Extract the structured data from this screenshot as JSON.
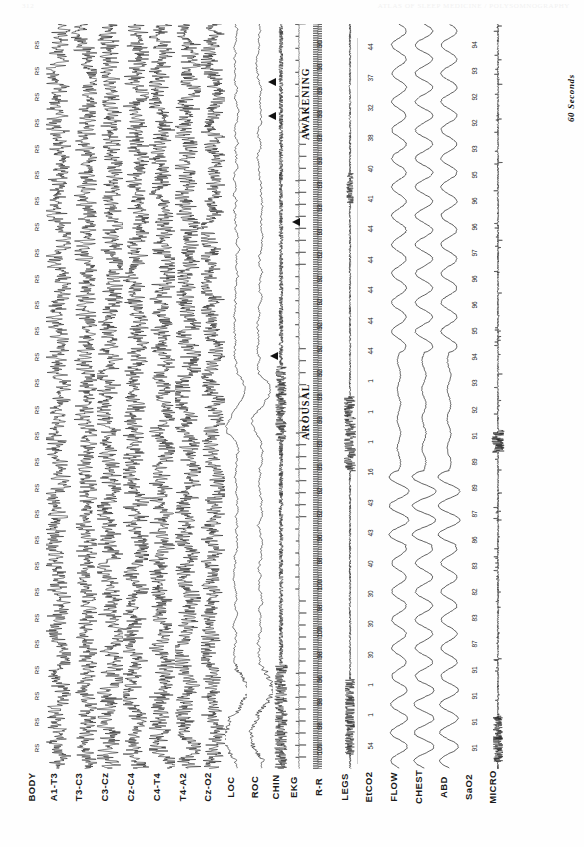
{
  "header": {
    "left_ghost": "312",
    "right_ghost": "ATLAS OF SLEEP MEDICINE / POLYSOMNOGRAPHY"
  },
  "figure": {
    "type": "polysomnogram",
    "orientation": "rotated-90-ccw",
    "time_scale_label": "60 Seconds",
    "annotations": [
      {
        "name": "arousal",
        "text": "AROUSAL"
      },
      {
        "name": "awakening",
        "text": "AWAKENING"
      }
    ]
  },
  "channels": [
    {
      "id": "body",
      "label": "BODY",
      "kind": "position"
    },
    {
      "id": "a1t3",
      "label": "A1-T3",
      "kind": "eeg"
    },
    {
      "id": "t3c3",
      "label": "T3-C3",
      "kind": "eeg"
    },
    {
      "id": "c3cz",
      "label": "C3-Cz",
      "kind": "eeg"
    },
    {
      "id": "czc4",
      "label": "Cz-C4",
      "kind": "eeg"
    },
    {
      "id": "c4t4",
      "label": "C4-T4",
      "kind": "eeg"
    },
    {
      "id": "t4a2",
      "label": "T4-A2",
      "kind": "eeg"
    },
    {
      "id": "czo2",
      "label": "Cz-O2",
      "kind": "eeg"
    },
    {
      "id": "loc",
      "label": "LOC",
      "kind": "eog"
    },
    {
      "id": "roc",
      "label": "ROC",
      "kind": "eog"
    },
    {
      "id": "chin",
      "label": "CHIN",
      "kind": "emg"
    },
    {
      "id": "ekg",
      "label": "EKG",
      "kind": "ecg"
    },
    {
      "id": "rr",
      "label": "R-R",
      "kind": "numeric"
    },
    {
      "id": "legs",
      "label": "LEGS",
      "kind": "emg"
    },
    {
      "id": "etco2",
      "label": "EtCO2",
      "kind": "numeric"
    },
    {
      "id": "flow",
      "label": "FLOW",
      "kind": "respiratory"
    },
    {
      "id": "chest",
      "label": "CHEST",
      "kind": "respiratory"
    },
    {
      "id": "abd",
      "label": "ABD",
      "kind": "respiratory"
    },
    {
      "id": "sao2",
      "label": "SaO2",
      "kind": "numeric"
    },
    {
      "id": "micro",
      "label": "MICRO",
      "kind": "sound"
    }
  ],
  "chart_data": {
    "type": "line",
    "xlabel": "Time",
    "ylabel": "Channel",
    "grid": false,
    "legend": "none",
    "epoch_duration_label": "60 Seconds",
    "series": [
      {
        "name": "BODY",
        "type": "categorical-marker",
        "values": [
          "RS",
          "RS",
          "RS",
          "RS",
          "RS",
          "RS",
          "RS",
          "RS",
          "RS",
          "RS",
          "RS",
          "RS",
          "RS",
          "RS",
          "RS",
          "RS",
          "RS",
          "RS",
          "RS",
          "RS",
          "RS",
          "RS",
          "RS",
          "RS",
          "RS",
          "RS",
          "RS",
          "RS"
        ],
        "note": "RS = right side body position, constant across epoch"
      },
      {
        "name": "R-R",
        "type": "numeric-ticks",
        "values": [
          90,
          93,
          93,
          93,
          93,
          93,
          93,
          93,
          93,
          92,
          92,
          92,
          92,
          92,
          92,
          93,
          93,
          95,
          95,
          92,
          92,
          96,
          98,
          100,
          98,
          100,
          98,
          96,
          98,
          98,
          100
        ]
      },
      {
        "name": "EtCO2",
        "type": "numeric-ticks",
        "values": [
          44,
          37,
          32,
          38,
          40,
          41,
          44,
          44,
          44,
          44,
          44,
          1,
          1,
          1,
          16,
          43,
          43,
          40,
          30,
          30,
          30,
          1,
          1,
          54
        ]
      },
      {
        "name": "SaO2",
        "type": "numeric-ticks",
        "values": [
          94,
          93,
          92,
          92,
          93,
          95,
          96,
          96,
          97,
          96,
          96,
          95,
          94,
          93,
          92,
          91,
          89,
          89,
          87,
          86,
          83,
          82,
          83,
          87,
          91,
          91,
          91,
          91
        ]
      }
    ],
    "events": [
      {
        "label": "AROUSAL",
        "channels": [
          "LOC",
          "ROC",
          "CHIN"
        ]
      },
      {
        "label": "AWAKENING",
        "channels": [
          "LOC",
          "ROC",
          "CHIN"
        ]
      }
    ]
  }
}
